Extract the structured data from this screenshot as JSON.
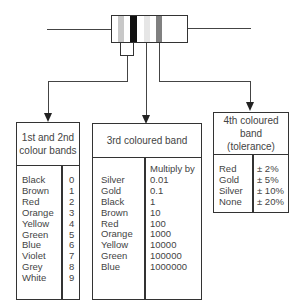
{
  "resistor": {
    "band_colors": [
      "#c8c8c8",
      "#ffffff",
      "#111111",
      "#ffffff",
      "#e8e8e8",
      "#ffffff",
      "#808080"
    ]
  },
  "box1": {
    "title_line1": "1st and 2nd",
    "title_line2": "colour bands",
    "colors": "Black\nBrown\nRed\nOrange\nYellow\nGreen\nBlue\nViolet\nGrey\nWhite",
    "values": "0\n1\n2\n3\n4\n5\n6\n7\n8\n9"
  },
  "box2": {
    "title": "3rd coloured band",
    "colors": "\nSilver\nGold\nBlack\nBrown\nRed\nOrange\nYellow\nGreen\nBlue",
    "values": "Multiply by\n0.01\n0.1\n1\n10\n100\n1000\n10000\n100000\n1000000"
  },
  "box3": {
    "title_line1": "4th coloured band",
    "title_line2": "(tolerance)",
    "colors": "Red\nGold\nSilver\nNone",
    "values": "± 2%\n± 5%\n± 10%\n± 20%"
  }
}
